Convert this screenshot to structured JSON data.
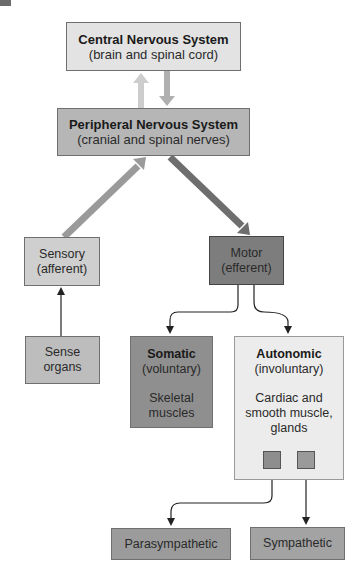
{
  "diagram": {
    "cns": {
      "title": "Central Nervous System",
      "subtitle": "(brain and spinal cord)"
    },
    "pns": {
      "title": "Peripheral Nervous System",
      "subtitle": "(cranial and spinal nerves)"
    },
    "sensory": {
      "line1": "Sensory",
      "line2": "(afferent)"
    },
    "motor": {
      "line1": "Motor",
      "line2": "(efferent)"
    },
    "sense_organs": {
      "line1": "Sense",
      "line2": "organs"
    },
    "somatic": {
      "title": "Somatic",
      "subtitle": "(voluntary)",
      "desc1": "Skeletal",
      "desc2": "muscles"
    },
    "autonomic": {
      "title": "Autonomic",
      "subtitle": "(involuntary)",
      "desc1": "Cardiac and",
      "desc2": "smooth muscle,",
      "desc3": "glands"
    },
    "parasympathetic": {
      "label": "Parasympathetic"
    },
    "sympathetic": {
      "label": "Sympathetic"
    }
  },
  "colors": {
    "cns_fill": "#e3e3e3",
    "pns_fill": "#b6b6b6",
    "sensory_fill": "#cfcfcf",
    "motor_fill": "#7d7d7d",
    "somatic_fill": "#8f8f8f",
    "autonomic_fill": "#ececec",
    "arrow_light": "#c9c9c9",
    "arrow_mid": "#a9a9a9",
    "arrow_dark": "#6e6e6e"
  }
}
